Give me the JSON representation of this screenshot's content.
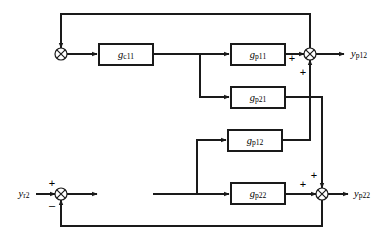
{
  "diagram": {
    "type": "control-block-diagram",
    "canvas": {
      "width": 386,
      "height": 240
    },
    "colors": {
      "line": "#1a1a1a",
      "background": "#ffffff",
      "text": "#000000"
    },
    "blocks": [
      {
        "id": "gc11",
        "base": "g",
        "sub": "c11",
        "x": 99,
        "y": 44,
        "w": 54,
        "h": 21
      },
      {
        "id": "gp11",
        "base": "g",
        "sub": "p11",
        "x": 231,
        "y": 44,
        "w": 54,
        "h": 21
      },
      {
        "id": "gp21",
        "base": "g",
        "sub": "p21",
        "x": 231,
        "y": 87,
        "w": 54,
        "h": 21
      },
      {
        "id": "gp12",
        "base": "g",
        "sub": "p12",
        "x": 228,
        "y": 130,
        "w": 54,
        "h": 21
      },
      {
        "id": "gp22",
        "base": "g",
        "sub": "p22",
        "x": 231,
        "y": 183,
        "w": 54,
        "h": 21
      }
    ],
    "junctions": [
      {
        "id": "sum1",
        "cx": 61,
        "cy": 54,
        "r": 6
      },
      {
        "id": "sum2",
        "cx": 310,
        "cy": 54,
        "r": 6
      },
      {
        "id": "sum3",
        "cx": 61,
        "cy": 194,
        "r": 6
      },
      {
        "id": "sum4",
        "cx": 322,
        "cy": 194,
        "r": 6
      }
    ],
    "signals": [
      {
        "id": "yr2",
        "base": "y",
        "sub": "r2",
        "x": 24,
        "y": 194
      },
      {
        "id": "yp12",
        "base": "y",
        "sub": "p12",
        "x": 359,
        "y": 54
      },
      {
        "id": "yp22",
        "base": "y",
        "sub": "p22",
        "x": 362,
        "y": 194
      }
    ],
    "signs": [
      {
        "id": "sum2-plus-left",
        "text": "+",
        "x": 292,
        "y": 58
      },
      {
        "id": "sum2-plus-below",
        "text": "+",
        "x": 303,
        "y": 72
      },
      {
        "id": "sum3-plus",
        "text": "+",
        "x": 52,
        "y": 183
      },
      {
        "id": "sum3-minus",
        "text": "–",
        "x": 52,
        "y": 205
      },
      {
        "id": "sum4-plus-left",
        "text": "+",
        "x": 303,
        "y": 184
      },
      {
        "id": "sum4-plus-above",
        "text": "+",
        "x": 314,
        "y": 175
      }
    ]
  }
}
